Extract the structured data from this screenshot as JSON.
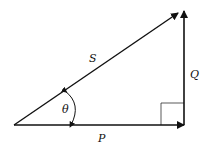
{
  "diagram": {
    "type": "vector-triangle",
    "vectors": [
      {
        "name": "P",
        "label": "P",
        "direction": "horizontal-right"
      },
      {
        "name": "Q",
        "label": "Q",
        "direction": "vertical-up"
      },
      {
        "name": "S",
        "label": "S",
        "direction": "diagonal-resultant"
      }
    ],
    "angle_label": "θ",
    "right_angle_marker": true,
    "colors": {
      "stroke": "#111111",
      "background": "#ffffff"
    }
  }
}
